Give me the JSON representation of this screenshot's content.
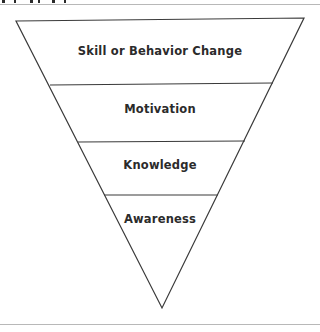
{
  "diagram": {
    "type": "inverted-pyramid",
    "levels": [
      {
        "label": "Skill or Behavior Change"
      },
      {
        "label": "Motivation"
      },
      {
        "label": "Knowledge"
      },
      {
        "label": "Awareness"
      }
    ]
  },
  "colors": {
    "stroke": "#3a3a3a",
    "text": "#2b2b2b",
    "rule": "#b8b8b8",
    "background": "#ffffff"
  }
}
